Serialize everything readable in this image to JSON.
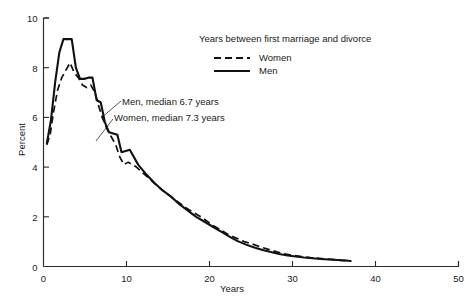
{
  "chart_data": {
    "type": "line",
    "title": "",
    "xlabel": "Years",
    "ylabel": "Percent",
    "xlim": [
      0,
      50
    ],
    "ylim": [
      0,
      10
    ],
    "grid": false,
    "legend_position": "top-right",
    "legend_title": "Years between first marriage and divorce",
    "x_ticks": [
      0,
      10,
      20,
      30,
      40,
      50
    ],
    "x_tick_labels": [
      "0",
      "10",
      "20",
      "30",
      "40",
      "50"
    ],
    "y_ticks": [
      0,
      2,
      4,
      6,
      8,
      10
    ],
    "y_tick_labels": [
      "0",
      "2",
      "4",
      "6",
      "8",
      "10"
    ],
    "annotations": [
      "Men, median 6.7 years",
      "Women, median 7.3 years"
    ],
    "series": [
      {
        "name": "Women",
        "style": "dashed",
        "color": "#111111",
        "x": [
          0.4,
          0.8,
          1.2,
          1.7,
          2.2,
          2.7,
          3.2,
          3.7,
          4.2,
          4.7,
          5.2,
          5.7,
          6.2,
          6.7,
          7.2,
          7.7,
          8.2,
          8.7,
          9.2,
          9.7,
          10.2,
          11.2,
          12.2,
          13.2,
          14.2,
          15.2,
          16.2,
          17.2,
          18.2,
          19.2,
          20.2,
          21.2,
          22.2,
          23.2,
          24.2,
          25.2,
          26.2,
          27.2,
          28.2,
          29.2,
          30.2,
          31.2,
          32.2,
          33.2,
          34.2,
          35.2,
          36.2,
          37.0
        ],
        "values": [
          4.9,
          5.3,
          6.2,
          7.1,
          7.6,
          7.9,
          8.2,
          7.8,
          7.6,
          7.3,
          7.2,
          7.3,
          7.0,
          6.4,
          5.9,
          5.5,
          5.2,
          4.9,
          4.4,
          4.1,
          4.2,
          4.0,
          3.7,
          3.4,
          3.1,
          2.85,
          2.6,
          2.35,
          2.15,
          1.95,
          1.7,
          1.5,
          1.3,
          1.15,
          1.0,
          0.9,
          0.78,
          0.68,
          0.58,
          0.5,
          0.44,
          0.4,
          0.36,
          0.33,
          0.3,
          0.27,
          0.24,
          0.22
        ]
      },
      {
        "name": "Men",
        "style": "solid",
        "color": "#111111",
        "x": [
          0.4,
          0.9,
          1.4,
          1.9,
          2.4,
          2.9,
          3.4,
          3.9,
          4.4,
          4.9,
          5.4,
          5.9,
          6.4,
          6.9,
          7.4,
          7.9,
          8.4,
          8.9,
          9.4,
          9.9,
          10.4,
          11.4,
          12.4,
          13.4,
          14.4,
          15.4,
          16.4,
          17.4,
          18.4,
          19.4,
          20.4,
          21.4,
          22.4,
          23.4,
          24.4,
          25.4,
          26.4,
          27.4,
          28.4,
          29.4,
          30.4,
          31.4,
          32.4,
          33.4,
          34.4,
          35.4,
          36.4,
          37.0
        ],
        "values": [
          4.95,
          5.9,
          7.4,
          8.6,
          9.15,
          9.15,
          9.15,
          8.0,
          7.55,
          7.55,
          7.6,
          7.6,
          6.7,
          6.6,
          5.8,
          5.4,
          5.35,
          5.3,
          4.6,
          4.65,
          4.7,
          4.1,
          3.7,
          3.35,
          3.05,
          2.8,
          2.5,
          2.25,
          2.0,
          1.8,
          1.6,
          1.4,
          1.2,
          1.02,
          0.88,
          0.76,
          0.66,
          0.58,
          0.5,
          0.44,
          0.4,
          0.36,
          0.33,
          0.3,
          0.28,
          0.26,
          0.24,
          0.22
        ]
      }
    ]
  },
  "axes": {
    "x_title": "Years",
    "y_title": "Percent"
  },
  "legend": {
    "title": "Years between first marriage and divorce",
    "items": [
      {
        "label": "Women",
        "style": "dashed"
      },
      {
        "label": "Men",
        "style": "solid"
      }
    ]
  },
  "annotations": {
    "men": "Men, median 6.7 years",
    "women": "Women, median 7.3 years"
  }
}
